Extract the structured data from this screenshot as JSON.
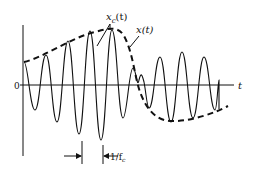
{
  "figure": {
    "axes": {
      "origin_label": "0",
      "x_axis_label": "t"
    },
    "curves": [
      {
        "name": "carrier",
        "label": "x_c(t)",
        "style": "solid"
      },
      {
        "name": "envelope",
        "label": "x(t)",
        "style": "dashed"
      }
    ],
    "labels": {
      "carrier_main": "x",
      "carrier_sub": "c",
      "carrier_arg": "(t)",
      "envelope": "x(t)",
      "period": "1/f",
      "period_sub": "c"
    },
    "colors": {
      "ink": "#111111",
      "background": "#ffffff"
    }
  }
}
